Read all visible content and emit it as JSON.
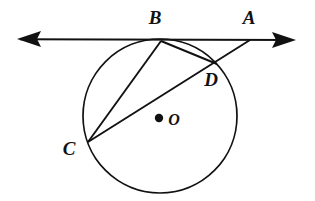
{
  "figure": {
    "background_color": "#ffffff",
    "stroke_color": "#111111",
    "width": 315,
    "height": 201
  },
  "circle": {
    "name": "circle-O",
    "center_x": 160,
    "center_y": 116,
    "radius": 77,
    "center_label": "O",
    "center_label_x": 172,
    "center_label_y": 125,
    "center_dot_x": 159,
    "center_dot_y": 118,
    "center_dot_radius": 4.2
  },
  "points": [
    {
      "id": "A",
      "label": "A",
      "x": 250,
      "y": 40,
      "label_x": 246,
      "label_y": 24,
      "on_circle": false,
      "description": "intersection of tangent line and secant"
    },
    {
      "id": "B",
      "label": "B",
      "x": 161,
      "y": 41,
      "label_x": 155,
      "label_y": 24,
      "on_circle": true,
      "description": "point of tangency"
    },
    {
      "id": "C",
      "label": "C",
      "x": 88,
      "y": 142,
      "label_x": 62,
      "label_y": 155,
      "on_circle": true,
      "description": "lower left point on circle"
    },
    {
      "id": "D",
      "label": "D",
      "x": 216,
      "y": 63,
      "label_x": 205,
      "label_y": 86,
      "on_circle": true,
      "description": "secant intersection with circle"
    }
  ],
  "tangent_line": {
    "name": "tangent-line-through-B",
    "x1": 18,
    "y1": 39,
    "x2": 295,
    "y2": 40,
    "left_arrow": true,
    "right_arrow": true
  },
  "segments": [
    {
      "id": "BC",
      "from": "B",
      "to": "C",
      "type": "chord",
      "label": "chord B to C"
    },
    {
      "id": "BD",
      "from": "B",
      "to": "D",
      "type": "chord",
      "label": "chord B to D"
    },
    {
      "id": "CA",
      "from": "C",
      "to": "A",
      "type": "secant",
      "label": "secant from C through D to A"
    }
  ],
  "labels_note": "Bold italic serif letters A, B, C, D, O"
}
